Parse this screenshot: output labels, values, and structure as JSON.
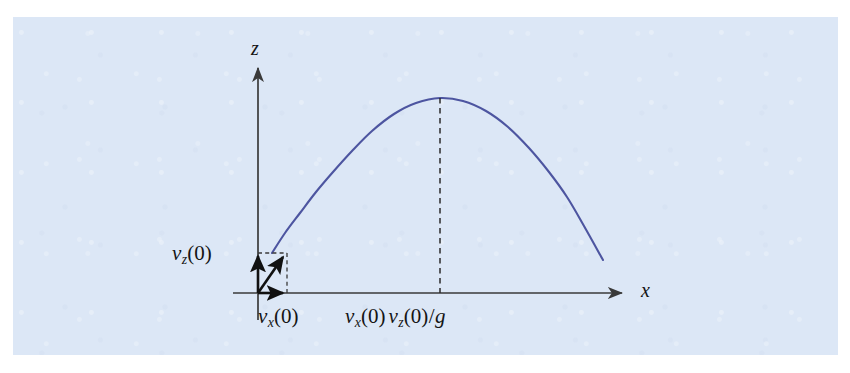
{
  "figure": {
    "kind": "projectile-trajectory-diagram",
    "background_color": "#dce7f6",
    "page_color": "#ffffff",
    "curve_color": "#4d55a0",
    "axis_color": "#3a3a3a",
    "label_color": "#141414"
  },
  "axes": {
    "x_axis_label": "x",
    "z_axis_label": "z",
    "origin_px": [
      258,
      293
    ],
    "x_axis_start_px": [
      233,
      293
    ],
    "x_axis_end_px": [
      622,
      293
    ],
    "z_axis_bottom_px": [
      258,
      320
    ],
    "z_axis_top_px": [
      258,
      68
    ]
  },
  "labels": {
    "vz0": {
      "v": "v",
      "sub": "z",
      "arg": "(0)"
    },
    "vx0": {
      "v": "v",
      "sub": "x",
      "arg": "(0)"
    },
    "apex": {
      "v1": "v",
      "sub1": "x",
      "arg1": "(0)",
      "v2": "v",
      "sub2": "z",
      "arg2": "(0)",
      "slash": "/",
      "g": "g"
    }
  },
  "chart_data": {
    "type": "line",
    "title": "",
    "xlabel": "x",
    "ylabel": "z",
    "grid": false,
    "legend": null,
    "annotations": [
      {
        "text": "v_z(0)",
        "role": "vertical-velocity-component-label",
        "px": [
          172,
          243
        ]
      },
      {
        "text": "v_x(0)",
        "role": "horizontal-velocity-component-label",
        "px": [
          258,
          306
        ]
      },
      {
        "text": "v_x(0) v_z(0) / g",
        "role": "apex-horizontal-position-label",
        "px": [
          345,
          306
        ]
      },
      {
        "text": "x",
        "role": "x-axis-name",
        "px": [
          641,
          280
        ]
      },
      {
        "text": "z",
        "role": "z-axis-name",
        "px": [
          251,
          38
        ]
      }
    ],
    "series": [
      {
        "name": "trajectory",
        "type": "parabola",
        "color": "#4d55a0",
        "start_px": [
          272,
          253
        ],
        "apex_px": [
          440,
          98
        ],
        "end_px": [
          603,
          260
        ],
        "points_px": [
          [
            272,
            253
          ],
          [
            285,
            233
          ],
          [
            300,
            213
          ],
          [
            316,
            192
          ],
          [
            333,
            172
          ],
          [
            352,
            151
          ],
          [
            372,
            131
          ],
          [
            394,
            114
          ],
          [
            416,
            103
          ],
          [
            440,
            98
          ],
          [
            463,
            101
          ],
          [
            486,
            111
          ],
          [
            508,
            127
          ],
          [
            529,
            148
          ],
          [
            549,
            172
          ],
          [
            567,
            197
          ],
          [
            584,
            226
          ],
          [
            603,
            260
          ]
        ]
      }
    ],
    "guides": [
      {
        "name": "apex-dashed-dropline",
        "style": "dashed",
        "from_px": [
          440,
          98
        ],
        "to_px": [
          440,
          293
        ]
      },
      {
        "name": "vz-dashed-top",
        "style": "dashed",
        "from_px": [
          258,
          253
        ],
        "to_px": [
          286,
          253
        ]
      },
      {
        "name": "vx-dashed-right",
        "style": "dashed",
        "from_px": [
          286,
          253
        ],
        "to_px": [
          286,
          293
        ]
      }
    ],
    "vectors": [
      {
        "name": "vz-component-arrow",
        "from_px": [
          258,
          293
        ],
        "to_px": [
          258,
          254
        ],
        "color": "#111111"
      },
      {
        "name": "vx-component-arrow",
        "from_px": [
          258,
          293
        ],
        "to_px": [
          286,
          293
        ],
        "color": "#111111"
      },
      {
        "name": "resultant-velocity-arrow",
        "from_px": [
          258,
          293
        ],
        "to_px": [
          285,
          254
        ],
        "color": "#111111"
      }
    ]
  }
}
